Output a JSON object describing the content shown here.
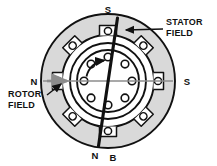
{
  "figure": {
    "background_color": "#ffffff",
    "ink_color": "#111111",
    "stator_fill": "#d9d9d9",
    "rotor_fill": "#ffffff",
    "field_line_color": "#8c8c8c"
  },
  "labels": {
    "pole_top": "S",
    "pole_right": "S",
    "pole_left": "N",
    "pole_bottom": "N",
    "flux_axis": "B",
    "stator_field_line1": "STATOR",
    "stator_field_line2": "FIELD",
    "rotor_field_line1": "ROTOR",
    "rotor_field_line2": "FIELD"
  },
  "geometry": {
    "center_x": 108,
    "center_y": 81,
    "stator_outer_radius": 67,
    "stator_bore_radius": 46,
    "rotor_outer_radius": 38,
    "rotor_inner_radius": 31,
    "rotor_bar_orbit_radius": 24,
    "rotor_bar_radius": 3.6,
    "stator_slot_count": 8,
    "rotor_bar_count": 8,
    "stator_field_axis_degrees": 8,
    "rotor_field_axis_degrees": 0
  },
  "elements": {
    "stator_ring": "stator-ring",
    "rotor_body": "rotor-body",
    "stator_field_axis": "stator-field-axis",
    "rotor_field_axis": "rotor-field-axis",
    "rotation_arrow": "rotation-arrow"
  }
}
